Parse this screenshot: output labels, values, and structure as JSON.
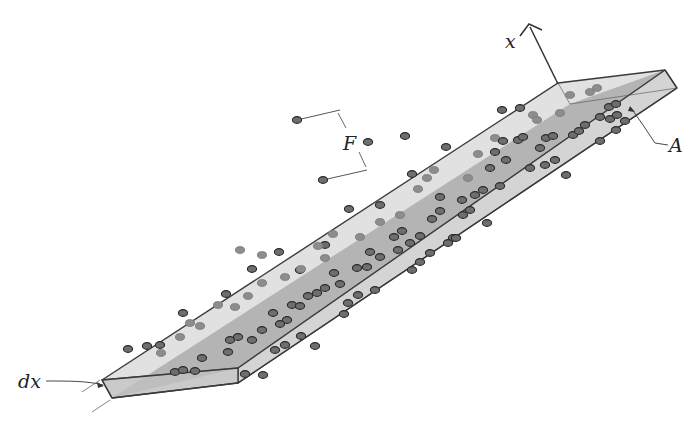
{
  "figure": {
    "labels": {
      "axis": "x",
      "area": "A",
      "thickness": "dx",
      "flux": "F"
    },
    "colors": {
      "background": "#ffffff",
      "slab_top": "#d9d9d9",
      "slab_front": "#c4c4c4",
      "slab_inner": "#8f8f8f",
      "slab_right": "#bdbdbd",
      "edge": "#3a3a3a",
      "particle_fill": "#6e6e6e",
      "particle_stroke": "#2a2a2a",
      "particle_faint": "#9a9a9a"
    }
  }
}
